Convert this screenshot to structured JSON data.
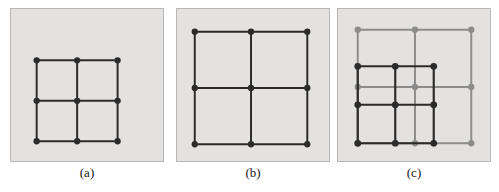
{
  "figure": {
    "width": 499,
    "height": 192,
    "page_background": "#ffffff",
    "panel_background": "#e3e2e0",
    "panel_border_color": "#b9b8b6",
    "dark_color": "#2b2b2b",
    "gray_color": "#8c8c8c"
  },
  "panels": [
    {
      "id": "a",
      "caption": "(a)",
      "description": "coarse 3 by 3 lattice of dark nodes",
      "graphs": [
        {
          "name": "dark-grid",
          "color": "#2b2b2b",
          "node_radius": 3.2,
          "line_width": 2.0,
          "xs": [
            26,
            67,
            108
          ],
          "ys": [
            52,
            93,
            134
          ]
        }
      ]
    },
    {
      "id": "b",
      "caption": "(b)",
      "description": "wide 3 by 3 lattice of dark nodes",
      "graphs": [
        {
          "name": "dark-grid",
          "color": "#2b2b2b",
          "node_radius": 3.2,
          "line_width": 2.0,
          "xs": [
            18,
            75,
            132
          ],
          "ys": [
            23,
            80,
            137
          ]
        }
      ]
    },
    {
      "id": "c",
      "caption": "(c)",
      "description": "superposition of the coarse dark lattice over the wide gray lattice",
      "graphs": [
        {
          "name": "gray-grid",
          "color": "#8c8c8c",
          "node_radius": 3.2,
          "line_width": 2.0,
          "xs": [
            20,
            78,
            135
          ],
          "ys": [
            21,
            79,
            136
          ]
        },
        {
          "name": "dark-grid",
          "color": "#2b2b2b",
          "node_radius": 3.4,
          "line_width": 2.2,
          "xs": [
            20,
            58,
            97
          ],
          "ys": [
            58,
            97,
            136
          ]
        }
      ]
    }
  ],
  "chart_data": {
    "type": "diagram",
    "title": "",
    "subtitle": "",
    "xlabel": "",
    "ylabel": "",
    "grid": false,
    "legend": "none",
    "annotations": [
      "(a)",
      "(b)",
      "(c)"
    ],
    "series": [
      {
        "name": "panel-a-dark-lattice",
        "panel": "a",
        "color": "#2b2b2b",
        "nodes": [
          [
            26,
            52
          ],
          [
            67,
            52
          ],
          [
            108,
            52
          ],
          [
            26,
            93
          ],
          [
            67,
            93
          ],
          [
            108,
            93
          ],
          [
            26,
            134
          ],
          [
            67,
            134
          ],
          [
            108,
            134
          ]
        ],
        "node_count": 9,
        "edge_count": 12,
        "cells": "2 x 2"
      },
      {
        "name": "panel-b-dark-lattice",
        "panel": "b",
        "color": "#2b2b2b",
        "nodes": [
          [
            18,
            23
          ],
          [
            75,
            23
          ],
          [
            132,
            23
          ],
          [
            18,
            80
          ],
          [
            75,
            80
          ],
          [
            132,
            80
          ],
          [
            18,
            137
          ],
          [
            75,
            137
          ],
          [
            132,
            137
          ]
        ],
        "node_count": 9,
        "edge_count": 12,
        "cells": "2 x 2"
      },
      {
        "name": "panel-c-gray-lattice",
        "panel": "c",
        "color": "#8c8c8c",
        "nodes": [
          [
            20,
            21
          ],
          [
            78,
            21
          ],
          [
            135,
            21
          ],
          [
            20,
            79
          ],
          [
            78,
            79
          ],
          [
            135,
            79
          ],
          [
            20,
            136
          ],
          [
            78,
            136
          ],
          [
            135,
            136
          ]
        ],
        "node_count": 9,
        "edge_count": 12,
        "cells": "2 x 2"
      },
      {
        "name": "panel-c-dark-lattice",
        "panel": "c",
        "color": "#2b2b2b",
        "nodes": [
          [
            20,
            58
          ],
          [
            58,
            58
          ],
          [
            97,
            58
          ],
          [
            20,
            97
          ],
          [
            58,
            97
          ],
          [
            97,
            97
          ],
          [
            20,
            136
          ],
          [
            58,
            136
          ],
          [
            97,
            136
          ]
        ],
        "node_count": 9,
        "edge_count": 12,
        "cells": "2 x 2"
      }
    ]
  }
}
